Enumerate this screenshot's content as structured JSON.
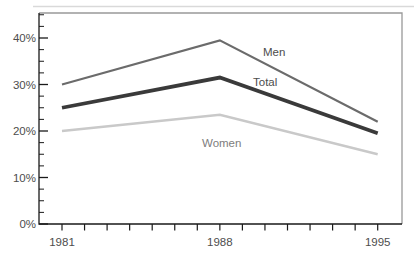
{
  "chart_data": {
    "type": "line",
    "title": "",
    "xlabel": "",
    "ylabel": "",
    "x": [
      1981,
      1988,
      1995
    ],
    "series": [
      {
        "name": "Men",
        "values": [
          30,
          39.5,
          22
        ],
        "color": "#6b6b6b",
        "stroke_width": 2.2,
        "label": "Men",
        "label_pos": {
          "x": 263,
          "y": 56
        },
        "label_color": "#4d4d4d"
      },
      {
        "name": "Total",
        "values": [
          25,
          31.5,
          19.5
        ],
        "color": "#3a3a3a",
        "stroke_width": 3.8,
        "label": "Total",
        "label_pos": {
          "x": 253,
          "y": 86
        },
        "label_color": "#4d4d4d"
      },
      {
        "name": "Women",
        "values": [
          20,
          23.5,
          15
        ],
        "color": "#c9c9c9",
        "stroke_width": 2.4,
        "label": "Women",
        "label_pos": {
          "x": 202,
          "y": 147
        },
        "label_color": "#7d7d7d"
      }
    ],
    "x_axis": {
      "range": [
        1981,
        1995
      ],
      "minor_step": 1,
      "labeled_ticks": [
        {
          "value": 1981,
          "label": "1981"
        },
        {
          "value": 1988,
          "label": "1988"
        },
        {
          "value": 1995,
          "label": "1995"
        }
      ]
    },
    "y_axis": {
      "range": [
        0,
        45
      ],
      "minor_step": 2.5,
      "major_step": 10,
      "ticks": [
        {
          "value": 0,
          "label": "0%"
        },
        {
          "value": 10,
          "label": "10%"
        },
        {
          "value": 20,
          "label": "20%"
        },
        {
          "value": 30,
          "label": "30%"
        },
        {
          "value": 40,
          "label": "40%"
        }
      ]
    },
    "grid": false,
    "legend": "inline-labels"
  },
  "colors": {
    "background": "#ffffff",
    "axis": "#1a1a1a",
    "frame_top_right": "#999999",
    "tick_label": "#4d4d4d",
    "top_accent_line": "#d9d9d9"
  }
}
